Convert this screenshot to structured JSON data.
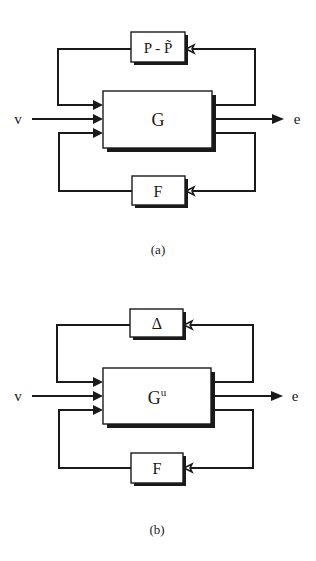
{
  "diagrams": [
    {
      "id": "a",
      "caption": "(a)",
      "main_block": {
        "label": "G",
        "superscript": ""
      },
      "top_block": {
        "label": "P - P̃"
      },
      "bottom_block": {
        "label": "F"
      },
      "input_label": "v",
      "output_label": "e"
    },
    {
      "id": "b",
      "caption": "(b)",
      "main_block": {
        "label": "G",
        "superscript": "u"
      },
      "top_block": {
        "label": "Δ"
      },
      "bottom_block": {
        "label": "F"
      },
      "input_label": "v",
      "output_label": "e"
    }
  ],
  "colors": {
    "line": "#1a1a1a",
    "background": "#ffffff"
  }
}
